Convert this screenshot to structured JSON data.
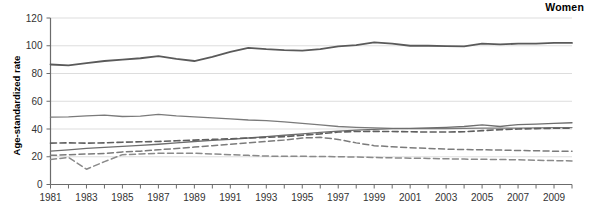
{
  "panel": {
    "title": "Women",
    "y_axis_title": "Age-standardized rate"
  },
  "chart_data": {
    "type": "line",
    "title": "Women",
    "xlabel": "",
    "ylabel": "Age-standardized rate",
    "ylim": [
      0,
      120
    ],
    "xlim": [
      1981,
      2010
    ],
    "yticks": [
      0,
      20,
      40,
      60,
      80,
      100,
      120
    ],
    "xticks": [
      1981,
      1983,
      1985,
      1987,
      1989,
      1991,
      1993,
      1995,
      1997,
      1999,
      2001,
      2003,
      2005,
      2007,
      2009
    ],
    "grid": "horizontal",
    "legend": "none",
    "x": [
      1981,
      1982,
      1983,
      1984,
      1985,
      1986,
      1987,
      1988,
      1989,
      1990,
      1991,
      1992,
      1993,
      1994,
      1995,
      1996,
      1997,
      1998,
      1999,
      2000,
      2001,
      2002,
      2003,
      2004,
      2005,
      2006,
      2007,
      2008,
      2009,
      2010
    ],
    "series": [
      {
        "name": "series-1-top-solid",
        "style": "solid",
        "color": "#5a5a5a",
        "width": 1.8,
        "values": [
          86.5,
          85.8,
          87.5,
          89.0,
          90.0,
          91.0,
          92.5,
          90.5,
          89.0,
          92.0,
          95.5,
          98.5,
          97.5,
          96.8,
          96.5,
          97.5,
          99.5,
          100.5,
          102.5,
          101.5,
          100.0,
          100.0,
          99.8,
          99.5,
          101.5,
          101.0,
          101.5,
          101.5,
          102.0,
          102.0
        ]
      },
      {
        "name": "series-2-solid-declining",
        "style": "solid",
        "color": "#7a7a7a",
        "width": 1.3,
        "values": [
          48.5,
          48.8,
          49.5,
          50.0,
          49.0,
          49.3,
          50.5,
          49.5,
          48.8,
          48.0,
          47.3,
          46.5,
          46.0,
          45.2,
          44.0,
          43.0,
          41.8,
          41.2,
          40.8,
          40.5,
          40.3,
          40.2,
          40.2,
          40.4,
          40.6,
          40.6,
          40.6,
          40.8,
          41.0,
          41.0
        ]
      },
      {
        "name": "series-3-solid-rising",
        "style": "solid",
        "color": "#6e6e6e",
        "width": 1.3,
        "values": [
          24.0,
          25.0,
          26.0,
          26.8,
          27.5,
          28.2,
          29.0,
          30.0,
          31.0,
          31.8,
          32.5,
          33.5,
          34.5,
          35.5,
          36.5,
          37.5,
          38.5,
          39.2,
          39.8,
          40.2,
          40.5,
          40.8,
          41.2,
          41.8,
          43.0,
          41.8,
          43.2,
          43.5,
          44.0,
          44.5
        ]
      },
      {
        "name": "series-4-dashed-upper",
        "style": "dashed",
        "color": "#5f5f5f",
        "width": 1.6,
        "values": [
          29.8,
          30.0,
          29.8,
          30.0,
          30.5,
          30.8,
          31.0,
          31.5,
          32.0,
          32.5,
          33.0,
          33.5,
          34.0,
          34.5,
          35.5,
          36.5,
          37.8,
          38.2,
          38.3,
          38.2,
          38.0,
          37.8,
          37.8,
          38.0,
          38.8,
          39.5,
          40.0,
          40.3,
          40.5,
          40.5
        ]
      },
      {
        "name": "series-5-dashed-middle",
        "style": "dashed",
        "color": "#7b7b7b",
        "width": 1.5,
        "values": [
          21.0,
          21.5,
          22.0,
          22.3,
          23.5,
          24.0,
          25.0,
          26.0,
          27.0,
          28.0,
          29.0,
          30.0,
          31.0,
          32.0,
          33.5,
          34.0,
          32.5,
          30.0,
          28.0,
          27.2,
          26.5,
          26.0,
          25.5,
          25.2,
          25.0,
          24.8,
          24.5,
          24.3,
          24.0,
          24.0
        ]
      },
      {
        "name": "series-6-dashed-lower",
        "style": "dashed",
        "color": "#8a8a8a",
        "width": 1.5,
        "values": [
          18.0,
          19.5,
          11.0,
          16.5,
          21.5,
          22.0,
          22.5,
          22.5,
          22.5,
          22.0,
          21.5,
          21.0,
          20.5,
          20.3,
          20.3,
          20.2,
          20.0,
          19.8,
          19.5,
          19.2,
          19.0,
          18.8,
          18.5,
          18.3,
          18.2,
          18.0,
          17.8,
          17.5,
          17.2,
          17.0
        ]
      }
    ]
  }
}
